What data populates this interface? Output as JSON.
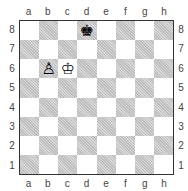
{
  "files": [
    "a",
    "b",
    "c",
    "d",
    "e",
    "f",
    "g",
    "h"
  ],
  "ranks": [
    "8",
    "7",
    "6",
    "5",
    "4",
    "3",
    "2",
    "1"
  ],
  "pieces": [
    {
      "square": "d8",
      "glyph": "♚",
      "name": "black-king"
    },
    {
      "square": "c6",
      "glyph": "♔",
      "name": "white-king"
    },
    {
      "square": "b6",
      "glyph": "♙",
      "name": "white-pawn"
    }
  ]
}
